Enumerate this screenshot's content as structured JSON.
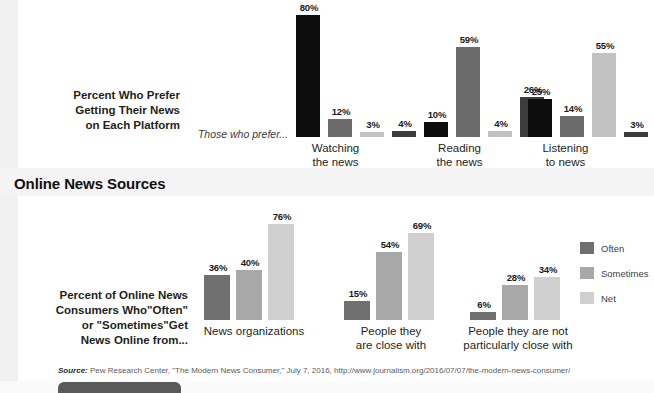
{
  "top_section": {
    "side_label": "Percent Who Prefer\nGetting Their News\non Each Platform",
    "note": "Those who prefer..."
  },
  "section_heading": "Online News Sources",
  "bottom_section": {
    "side_label": "Percent of Online News\nConsumers Who\"Often\"\nor \"Sometimes\"Get\nNews Online from..."
  },
  "legend": {
    "items": [
      {
        "label": "Often",
        "color": "#6f6f6f"
      },
      {
        "label": "Sometimes",
        "color": "#a8a8a8"
      },
      {
        "label": "Net",
        "color": "#cfcfcf"
      }
    ]
  },
  "source": {
    "prefix": "Source:",
    "text": " Pew Research Center, \"The Modern News Consumer,\" July 7, 2016, http://www.journalism.org/2016/07/07/the-modern-news-consumer/"
  },
  "chart_data": [
    {
      "type": "bar",
      "title": "Percent Who Prefer Getting Their News on Each Platform",
      "xlabel": "",
      "ylabel": "",
      "ylim": [
        0,
        80
      ],
      "grid": false,
      "legend_position": "none",
      "note": "Those who prefer...",
      "categories": [
        "Watching\nthe news",
        "Reading\nthe news",
        "Listening\nto news"
      ],
      "series": [
        {
          "name": "bar1",
          "color": "#0d0d0d",
          "values": [
            80,
            10,
            25
          ],
          "labels": [
            "80%",
            "10%",
            "25%"
          ]
        },
        {
          "name": "bar2",
          "color": "#6b6b6b",
          "values": [
            12,
            59,
            14
          ],
          "labels": [
            "12%",
            "59%",
            "14%"
          ]
        },
        {
          "name": "bar3",
          "color": "#c2c2c2",
          "values": [
            3,
            4,
            55
          ],
          "labels": [
            "3%",
            "4%",
            "55%"
          ]
        },
        {
          "name": "bar4",
          "color": "#3d3d3d",
          "values": [
            4,
            26,
            3
          ],
          "labels": [
            "4%",
            "26%",
            "3%"
          ]
        }
      ]
    },
    {
      "type": "bar",
      "title": "Online News Sources",
      "xlabel": "",
      "ylabel": "",
      "ylim": [
        0,
        76
      ],
      "grid": false,
      "legend_position": "right",
      "categories": [
        "News organizations",
        "People they\nare close with",
        "People they are not\nparticularly close with"
      ],
      "series": [
        {
          "name": "Often",
          "color": "#6f6f6f",
          "values": [
            36,
            15,
            6
          ],
          "labels": [
            "36%",
            "15%",
            "6%"
          ]
        },
        {
          "name": "Sometimes",
          "color": "#a8a8a8",
          "values": [
            40,
            54,
            28
          ],
          "labels": [
            "40%",
            "54%",
            "28%"
          ]
        },
        {
          "name": "Net",
          "color": "#cfcfcf",
          "values": [
            76,
            69,
            34
          ],
          "labels": [
            "76%",
            "69%",
            "34%"
          ]
        }
      ]
    }
  ]
}
